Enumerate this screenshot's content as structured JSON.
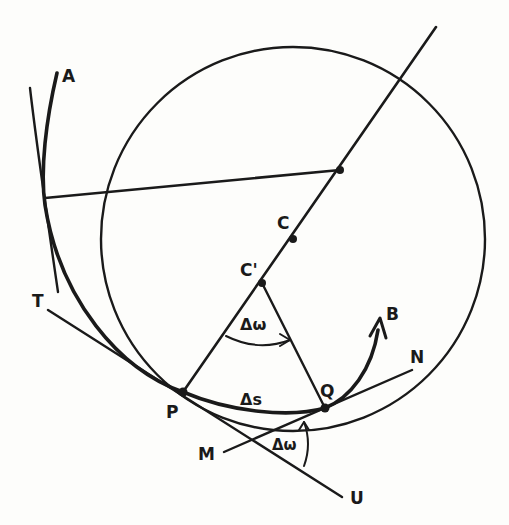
{
  "figure": {
    "colors": {
      "ink": "#1a1a1a",
      "background": "#fdfdfb"
    }
  },
  "labels": {
    "A": "A",
    "T": "T",
    "C": "C",
    "C_prime": "C'",
    "P": "P",
    "Q": "Q",
    "B": "B",
    "N": "N",
    "M": "M",
    "U": "U",
    "delta_omega_top": "Δω",
    "delta_s": "Δs",
    "delta_omega_bottom": "Δω"
  },
  "points": {
    "P": [
      183,
      392
    ],
    "Q": [
      325,
      408
    ],
    "C": [
      293,
      239
    ],
    "C_prime": [
      262,
      283
    ],
    "chord_point": [
      340,
      170
    ],
    "circle_center": [
      293,
      240
    ],
    "circle_radius": 192
  }
}
